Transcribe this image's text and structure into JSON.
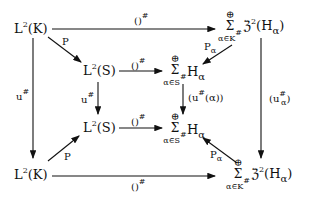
{
  "nodes": {
    "top_left": {
      "base": "L",
      "sup": "2",
      "arg": "(K)"
    },
    "mid_left": {
      "base": "L",
      "sup": "2",
      "arg": "(S)"
    },
    "mid_left_bottom": {
      "base": "L",
      "sup": "2",
      "arg": "(S)"
    },
    "bottom_left": {
      "base": "L",
      "sup": "2",
      "arg": "(K)"
    },
    "top_right": {
      "oplus": "⊕",
      "sigma": "Σ",
      "index": "α∈K",
      "index_sup": "#",
      "term": "ℨ",
      "term_sup": "2",
      "term_arg": "(H",
      "term_sub": "α",
      "close": ")"
    },
    "mid_right_top": {
      "oplus": "⊕",
      "sigma": "Σ",
      "index": "α∈S",
      "index_sup": "#",
      "term": "H",
      "term_sub": "α"
    },
    "mid_right_bottom": {
      "oplus": "⊕",
      "sigma": "Σ",
      "index": "α∈S",
      "index_sup": "#",
      "term": "H",
      "term_sub": "α"
    },
    "bottom_right": {
      "oplus": "⊕",
      "sigma": "Σ",
      "index": "α∈K",
      "index_sup": "#",
      "term": "ℨ",
      "term_sup": "2",
      "term_arg": "(H",
      "term_sub": "α",
      "close": ")"
    }
  },
  "arrows": {
    "top": {
      "label": "()",
      "sup": "#"
    },
    "mid_top": {
      "label": "()",
      "sup": "#"
    },
    "mid_bottom": {
      "label": "()",
      "sup": "#"
    },
    "bottom": {
      "label": "()",
      "sup": "#"
    },
    "diag_top_left": {
      "label": "P"
    },
    "diag_bottom_left": {
      "label": "P"
    },
    "diag_top_right": {
      "label": "P",
      "sub": "α"
    },
    "diag_bottom_right": {
      "label": "P",
      "sub": "α"
    },
    "left_vertical": {
      "label": "u",
      "sup": "#"
    },
    "inner_left_vertical": {
      "label": "u",
      "sup": "#"
    },
    "inner_right_vertical": {
      "label": "(u",
      "sup": "#",
      "arg": "(α))"
    },
    "right_vertical": {
      "label": "(u",
      "sup": "#",
      "sub": "α",
      "close": ")"
    }
  }
}
